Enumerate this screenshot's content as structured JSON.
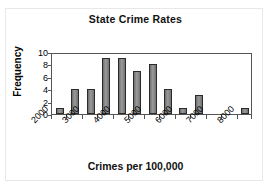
{
  "chart_data": {
    "type": "bar",
    "title": "State Crime Rates",
    "xlabel": "Crimes per 100,000",
    "ylabel": "Frequency",
    "subtitle": "",
    "grid": false,
    "legend": "none",
    "ylim": [
      0,
      10
    ],
    "ytick_labels": [
      "10",
      "8",
      "6",
      "4",
      "2",
      "0"
    ],
    "ytick_values": [
      10,
      8,
      6,
      4,
      2,
      0
    ],
    "xlim": [
      2000,
      8750
    ],
    "xtick_labels": [
      "2000",
      "3000",
      "4000",
      "5000",
      "6000",
      "7000",
      "8000"
    ],
    "xtick_values": [
      2000,
      3000,
      4000,
      5000,
      6000,
      7000,
      8000
    ],
    "bin_width": 500,
    "bin_starts": [
      2000,
      2500,
      3000,
      3500,
      4000,
      4500,
      5000,
      5500,
      6000,
      6500,
      7000,
      7500,
      8000
    ],
    "categories": [
      "2000",
      "2500",
      "3000",
      "3500",
      "4000",
      "4500",
      "5000",
      "5500",
      "6000",
      "6500",
      "7000",
      "7500",
      "8000"
    ],
    "values": [
      1,
      4,
      4,
      9,
      9,
      7,
      8,
      4,
      1,
      3,
      0,
      0,
      1
    ],
    "bar_color": "#808080",
    "bar_edge_color": "#2b2b2b",
    "axis_color": "#555555",
    "text_color": "#000000"
  },
  "chart": {
    "title": "State Crime Rates",
    "x_axis_title": "Crimes per 100,000",
    "y_axis_title": "Frequency"
  }
}
